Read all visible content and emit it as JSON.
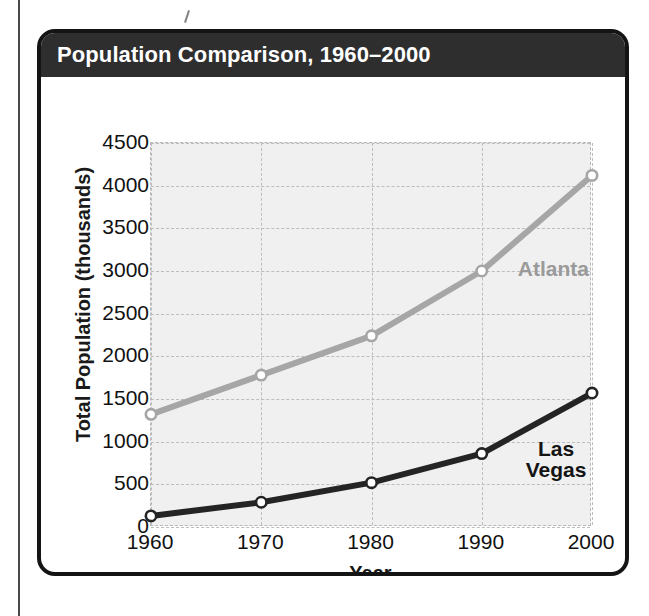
{
  "figure": {
    "title": "Population Comparison, 1960–2000",
    "source_note": "SOURCE: U.S. Bureau of Census",
    "header_bg": "#2e2e2e",
    "card_border": "#141414"
  },
  "chart_data": {
    "type": "line",
    "title": "Population Comparison, 1960–2000",
    "xlabel": "Year",
    "ylabel": "Total Population (thousands)",
    "x": [
      1960,
      1970,
      1980,
      1990,
      2000
    ],
    "xtick_labels": [
      "1960",
      "1970",
      "1980",
      "1990",
      "2000"
    ],
    "ytick_labels": [
      "0",
      "500",
      "1000",
      "1500",
      "2000",
      "2500",
      "3000",
      "3500",
      "4000",
      "4500"
    ],
    "yticks": [
      0,
      500,
      1000,
      1500,
      2000,
      2500,
      3000,
      3500,
      4000,
      4500
    ],
    "ylim": [
      0,
      4500
    ],
    "xlim": [
      1960,
      2000
    ],
    "grid": true,
    "legend_position": "inline-annotation",
    "series": [
      {
        "name": "Atlanta",
        "color": "#a6a6a6",
        "marker": "circle-open",
        "values": [
          1320,
          1780,
          2240,
          3000,
          4120
        ],
        "label_text": "Atlanta"
      },
      {
        "name": "Las Vegas",
        "color": "#242424",
        "marker": "circle-open",
        "values": [
          130,
          290,
          520,
          860,
          1570
        ],
        "label_text": "Las\nVegas"
      }
    ]
  },
  "axis": {
    "y_title": "Total Population (thousands)",
    "x_title": "Year"
  }
}
